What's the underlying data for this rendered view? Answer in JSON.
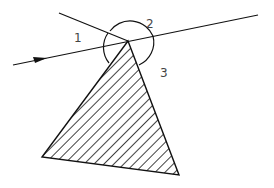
{
  "diagram": {
    "type": "geometry",
    "labels": [
      {
        "id": "angle-1",
        "text": "1",
        "x": 74,
        "y": 32
      },
      {
        "id": "angle-2",
        "text": "2",
        "x": 146,
        "y": 18
      },
      {
        "id": "angle-3",
        "text": "3",
        "x": 160,
        "y": 67
      }
    ],
    "colors": {
      "stroke": "#111111",
      "hatch": "#111111",
      "background": "#ffffff",
      "label": "#444444"
    },
    "geometry": {
      "apex": [
        128,
        41
      ],
      "triangle": [
        [
          128,
          41
        ],
        [
          42,
          157
        ],
        [
          179,
          175
        ]
      ],
      "ray": {
        "from": [
          13,
          65
        ],
        "to": [
          258,
          15
        ],
        "arrow_at": [
          40,
          59
        ]
      },
      "upper_line": {
        "from": [
          59,
          13
        ],
        "to": [
          128,
          41
        ]
      },
      "arc_radius": 26
    }
  }
}
